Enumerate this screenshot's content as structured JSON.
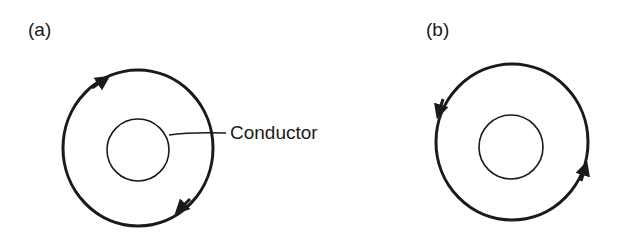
{
  "panels": [
    {
      "label": "(a)",
      "direction": "clockwise",
      "callout": "Conductor"
    },
    {
      "label": "(b)",
      "direction": "counterclockwise"
    }
  ],
  "colors": {
    "ink": "#1a1a1a",
    "background": "#ffffff"
  }
}
